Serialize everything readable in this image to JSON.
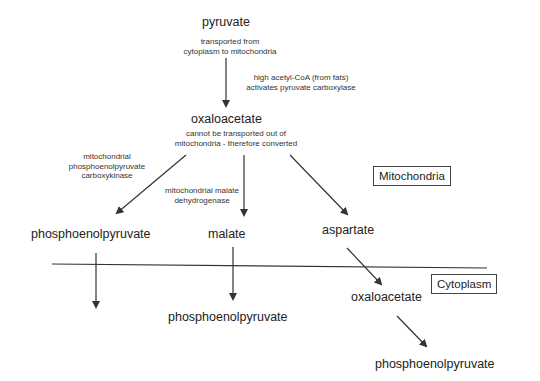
{
  "compounds": {
    "pyruvate": "pyruvate",
    "oxaloacetate_mito": "oxaloacetate",
    "pep_mito": "phosphoenolpyruvate",
    "malate": "malate",
    "aspartate": "aspartate",
    "pep_from_malate": "phosphoenolpyruvate",
    "oxaloacetate_cyto": "oxaloacetate",
    "pep_cyto": "phosphoenolpyruvate"
  },
  "notes": {
    "transport": [
      "transported from",
      "cytoplasm to mitochondria"
    ],
    "activation": [
      "high acetyl-CoA (from fats)",
      "activates pyruvate carboxylase"
    ],
    "oaa_note": [
      "cannot be transported out of",
      "mitochondria - therefore converted"
    ],
    "pepck": [
      "mitochondrial",
      "phosphoenolpyruvate",
      "carboxykinase"
    ],
    "mdh": [
      "mitochondrial malate",
      "dehydrogenase"
    ]
  },
  "compartments": {
    "mitochondria": "Mitochondria",
    "cytoplasm": "Cytoplasm"
  },
  "colors": {
    "line": "#333333",
    "text": "#222222"
  }
}
